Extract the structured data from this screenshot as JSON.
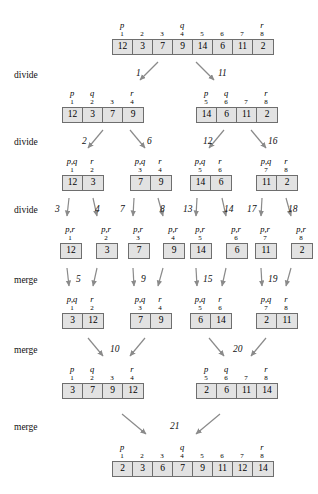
{
  "operations": [
    {
      "label": "divide",
      "x": 14,
      "y": 70
    },
    {
      "label": "divide",
      "x": 14,
      "y": 137
    },
    {
      "label": "divide",
      "x": 14,
      "y": 205
    },
    {
      "label": "merge",
      "x": 14,
      "y": 275
    },
    {
      "label": "merge",
      "x": 14,
      "y": 345
    },
    {
      "label": "merge",
      "x": 14,
      "y": 422
    }
  ],
  "steps": [
    {
      "num": "1",
      "x": 136,
      "y": 68
    },
    {
      "num": "11",
      "x": 218,
      "y": 68
    },
    {
      "num": "2",
      "x": 82,
      "y": 136
    },
    {
      "num": "6",
      "x": 147,
      "y": 136
    },
    {
      "num": "12",
      "x": 203,
      "y": 136
    },
    {
      "num": "16",
      "x": 268,
      "y": 136
    },
    {
      "num": "3",
      "x": 55,
      "y": 204
    },
    {
      "num": "4",
      "x": 95,
      "y": 204
    },
    {
      "num": "7",
      "x": 120,
      "y": 204
    },
    {
      "num": "8",
      "x": 160,
      "y": 204
    },
    {
      "num": "13",
      "x": 183,
      "y": 204
    },
    {
      "num": "14",
      "x": 224,
      "y": 204
    },
    {
      "num": "17",
      "x": 247,
      "y": 204
    },
    {
      "num": "18",
      "x": 288,
      "y": 204
    },
    {
      "num": "5",
      "x": 76,
      "y": 274
    },
    {
      "num": "9",
      "x": 141,
      "y": 274
    },
    {
      "num": "15",
      "x": 203,
      "y": 274
    },
    {
      "num": "19",
      "x": 268,
      "y": 274
    },
    {
      "num": "10",
      "x": 110,
      "y": 344
    },
    {
      "num": "20",
      "x": 233,
      "y": 344
    },
    {
      "num": "21",
      "x": 170,
      "y": 421
    }
  ],
  "arrays": [
    {
      "name": "root-array",
      "x": 112,
      "y": 20,
      "cellw": 20,
      "pointers": [
        {
          "text": "p",
          "i": 0
        },
        {
          "text": "q",
          "i": 3
        },
        {
          "text": "r",
          "i": 7
        }
      ],
      "indices": [
        "1",
        "2",
        "3",
        "4",
        "5",
        "6",
        "7",
        "8"
      ],
      "values": [
        "12",
        "3",
        "7",
        "9",
        "14",
        "6",
        "11",
        "2"
      ]
    },
    {
      "name": "divide1-left",
      "x": 62,
      "y": 88,
      "cellw": 20,
      "pointers": [
        {
          "text": "p",
          "i": 0
        },
        {
          "text": "q",
          "i": 1
        },
        {
          "text": "r",
          "i": 3
        }
      ],
      "indices": [
        "1",
        "2",
        "3",
        "4"
      ],
      "values": [
        "12",
        "3",
        "7",
        "9"
      ]
    },
    {
      "name": "divide1-right",
      "x": 196,
      "y": 88,
      "cellw": 20,
      "pointers": [
        {
          "text": "p",
          "i": 0
        },
        {
          "text": "q",
          "i": 1
        },
        {
          "text": "r",
          "i": 3
        }
      ],
      "indices": [
        "5",
        "6",
        "7",
        "8"
      ],
      "values": [
        "14",
        "6",
        "11",
        "2"
      ]
    },
    {
      "name": "divide2-a",
      "x": 62,
      "y": 156,
      "cellw": 20,
      "pointers": [
        {
          "text": "p,q",
          "i": 0
        },
        {
          "text": "r",
          "i": 1
        }
      ],
      "indices": [
        "1",
        "2"
      ],
      "values": [
        "12",
        "3"
      ]
    },
    {
      "name": "divide2-b",
      "x": 130,
      "y": 156,
      "cellw": 20,
      "pointers": [
        {
          "text": "p,q",
          "i": 0
        },
        {
          "text": "r",
          "i": 1
        }
      ],
      "indices": [
        "3",
        "4"
      ],
      "values": [
        "7",
        "9"
      ]
    },
    {
      "name": "divide2-c",
      "x": 190,
      "y": 156,
      "cellw": 20,
      "pointers": [
        {
          "text": "p,q",
          "i": 0
        },
        {
          "text": "r",
          "i": 1
        }
      ],
      "indices": [
        "5",
        "6"
      ],
      "values": [
        "14",
        "6"
      ]
    },
    {
      "name": "divide2-d",
      "x": 256,
      "y": 156,
      "cellw": 20,
      "pointers": [
        {
          "text": "p,q",
          "i": 0
        },
        {
          "text": "r",
          "i": 1
        }
      ],
      "indices": [
        "7",
        "8"
      ],
      "values": [
        "11",
        "2"
      ]
    },
    {
      "name": "leaf-1",
      "x": 60,
      "y": 224,
      "cellw": 20,
      "pointers": [
        {
          "text": "p,r",
          "i": 0
        }
      ],
      "indices": [
        "1"
      ],
      "values": [
        "12"
      ]
    },
    {
      "name": "leaf-2",
      "x": 96,
      "y": 224,
      "cellw": 20,
      "pointers": [
        {
          "text": "p,r",
          "i": 0
        }
      ],
      "indices": [
        "2"
      ],
      "values": [
        "3"
      ]
    },
    {
      "name": "leaf-3",
      "x": 128,
      "y": 224,
      "cellw": 20,
      "pointers": [
        {
          "text": "p,r",
          "i": 0
        }
      ],
      "indices": [
        "3"
      ],
      "values": [
        "7"
      ]
    },
    {
      "name": "leaf-4",
      "x": 163,
      "y": 224,
      "cellw": 20,
      "pointers": [
        {
          "text": "p,r",
          "i": 0
        }
      ],
      "indices": [
        "4"
      ],
      "values": [
        "9"
      ]
    },
    {
      "name": "leaf-5",
      "x": 190,
      "y": 224,
      "cellw": 20,
      "pointers": [
        {
          "text": "p,r",
          "i": 0
        }
      ],
      "indices": [
        "5"
      ],
      "values": [
        "14"
      ]
    },
    {
      "name": "leaf-6",
      "x": 226,
      "y": 224,
      "cellw": 20,
      "pointers": [
        {
          "text": "p,r",
          "i": 0
        }
      ],
      "indices": [
        "6"
      ],
      "values": [
        "6"
      ]
    },
    {
      "name": "leaf-7",
      "x": 255,
      "y": 224,
      "cellw": 20,
      "pointers": [
        {
          "text": "p,r",
          "i": 0
        }
      ],
      "indices": [
        "7"
      ],
      "values": [
        "11"
      ]
    },
    {
      "name": "leaf-8",
      "x": 291,
      "y": 224,
      "cellw": 20,
      "pointers": [
        {
          "text": "p,r",
          "i": 0
        }
      ],
      "indices": [
        "8"
      ],
      "values": [
        "2"
      ]
    },
    {
      "name": "merge1-a",
      "x": 62,
      "y": 294,
      "cellw": 20,
      "pointers": [
        {
          "text": "p,q",
          "i": 0
        },
        {
          "text": "r",
          "i": 1
        }
      ],
      "indices": [
        "1",
        "2"
      ],
      "values": [
        "3",
        "12"
      ]
    },
    {
      "name": "merge1-b",
      "x": 130,
      "y": 294,
      "cellw": 20,
      "pointers": [
        {
          "text": "p,q",
          "i": 0
        },
        {
          "text": "r",
          "i": 1
        }
      ],
      "indices": [
        "3",
        "4"
      ],
      "values": [
        "7",
        "9"
      ]
    },
    {
      "name": "merge1-c",
      "x": 190,
      "y": 294,
      "cellw": 20,
      "pointers": [
        {
          "text": "p,q",
          "i": 0
        },
        {
          "text": "r",
          "i": 1
        }
      ],
      "indices": [
        "5",
        "6"
      ],
      "values": [
        "6",
        "14"
      ]
    },
    {
      "name": "merge1-d",
      "x": 256,
      "y": 294,
      "cellw": 20,
      "pointers": [
        {
          "text": "p,q",
          "i": 0
        },
        {
          "text": "r",
          "i": 1
        }
      ],
      "indices": [
        "7",
        "8"
      ],
      "values": [
        "2",
        "11"
      ]
    },
    {
      "name": "merge2-left",
      "x": 62,
      "y": 364,
      "cellw": 20,
      "pointers": [
        {
          "text": "p",
          "i": 0
        },
        {
          "text": "q",
          "i": 1
        },
        {
          "text": "r",
          "i": 3
        }
      ],
      "indices": [
        "1",
        "2",
        "3",
        "4"
      ],
      "values": [
        "3",
        "7",
        "9",
        "12"
      ]
    },
    {
      "name": "merge2-right",
      "x": 196,
      "y": 364,
      "cellw": 20,
      "pointers": [
        {
          "text": "p",
          "i": 0
        },
        {
          "text": "q",
          "i": 1
        },
        {
          "text": "r",
          "i": 3
        }
      ],
      "indices": [
        "5",
        "6",
        "7",
        "8"
      ],
      "values": [
        "2",
        "6",
        "11",
        "14"
      ]
    },
    {
      "name": "final-array",
      "x": 112,
      "y": 442,
      "cellw": 20,
      "pointers": [
        {
          "text": "p",
          "i": 0
        },
        {
          "text": "q",
          "i": 3
        },
        {
          "text": "r",
          "i": 7
        }
      ],
      "indices": [
        "1",
        "2",
        "3",
        "4",
        "5",
        "6",
        "7",
        "8"
      ],
      "values": [
        "2",
        "3",
        "6",
        "7",
        "9",
        "11",
        "12",
        "14"
      ]
    }
  ],
  "arrows": [
    {
      "name": "divide-1-left",
      "x1": 158,
      "y1": 62,
      "x2": 140,
      "y2": 80
    },
    {
      "name": "divide-1-right",
      "x1": 196,
      "y1": 62,
      "x2": 214,
      "y2": 80
    },
    {
      "name": "divide-2-a",
      "x1": 103,
      "y1": 130,
      "x2": 88,
      "y2": 148
    },
    {
      "name": "divide-2-b",
      "x1": 130,
      "y1": 130,
      "x2": 145,
      "y2": 148
    },
    {
      "name": "divide-2-c",
      "x1": 224,
      "y1": 130,
      "x2": 209,
      "y2": 148
    },
    {
      "name": "divide-2-d",
      "x1": 251,
      "y1": 130,
      "x2": 266,
      "y2": 148
    },
    {
      "name": "divide-3-a",
      "x1": 69,
      "y1": 198,
      "x2": 67,
      "y2": 216
    },
    {
      "name": "divide-3-b",
      "x1": 93,
      "y1": 198,
      "x2": 97,
      "y2": 216
    },
    {
      "name": "divide-3-c",
      "x1": 134,
      "y1": 198,
      "x2": 133,
      "y2": 216
    },
    {
      "name": "divide-3-d",
      "x1": 158,
      "y1": 198,
      "x2": 163,
      "y2": 216
    },
    {
      "name": "divide-3-e",
      "x1": 197,
      "y1": 198,
      "x2": 196,
      "y2": 216
    },
    {
      "name": "divide-3-f",
      "x1": 222,
      "y1": 198,
      "x2": 226,
      "y2": 216
    },
    {
      "name": "divide-3-g",
      "x1": 262,
      "y1": 198,
      "x2": 261,
      "y2": 216
    },
    {
      "name": "divide-3-h",
      "x1": 286,
      "y1": 198,
      "x2": 291,
      "y2": 216
    },
    {
      "name": "merge-1-a-l",
      "x1": 67,
      "y1": 268,
      "x2": 69,
      "y2": 286
    },
    {
      "name": "merge-1-a-r",
      "x1": 97,
      "y1": 268,
      "x2": 93,
      "y2": 286
    },
    {
      "name": "merge-1-b-l",
      "x1": 133,
      "y1": 268,
      "x2": 134,
      "y2": 286
    },
    {
      "name": "merge-1-b-r",
      "x1": 163,
      "y1": 268,
      "x2": 158,
      "y2": 286
    },
    {
      "name": "merge-1-c-l",
      "x1": 196,
      "y1": 268,
      "x2": 197,
      "y2": 286
    },
    {
      "name": "merge-1-c-r",
      "x1": 226,
      "y1": 268,
      "x2": 222,
      "y2": 286
    },
    {
      "name": "merge-1-d-l",
      "x1": 261,
      "y1": 268,
      "x2": 262,
      "y2": 286
    },
    {
      "name": "merge-1-d-r",
      "x1": 291,
      "y1": 268,
      "x2": 286,
      "y2": 286
    },
    {
      "name": "merge-2-l",
      "x1": 88,
      "y1": 338,
      "x2": 103,
      "y2": 356
    },
    {
      "name": "merge-2-r",
      "x1": 145,
      "y1": 338,
      "x2": 130,
      "y2": 356
    },
    {
      "name": "merge-2-l2",
      "x1": 209,
      "y1": 338,
      "x2": 224,
      "y2": 356
    },
    {
      "name": "merge-2-r2",
      "x1": 266,
      "y1": 338,
      "x2": 251,
      "y2": 356
    },
    {
      "name": "merge-3-l",
      "x1": 122,
      "y1": 414,
      "x2": 146,
      "y2": 434
    },
    {
      "name": "merge-3-r",
      "x1": 220,
      "y1": 414,
      "x2": 196,
      "y2": 434
    }
  ],
  "colors": {
    "cell_fill": "#e2e2e2",
    "cell_border": "#6e6e6e",
    "arrow": "#8a8a8a",
    "text": "#000000"
  }
}
